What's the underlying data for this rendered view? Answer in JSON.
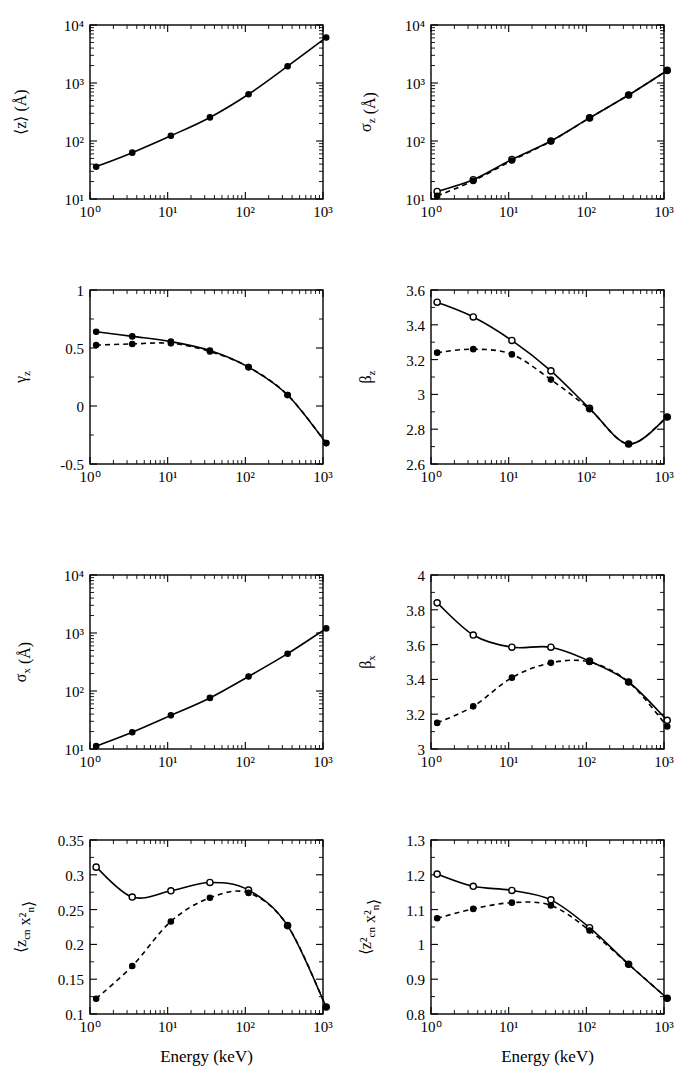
{
  "figure": {
    "xlabel": "Energy (keV)",
    "panels_rows": 4,
    "panels_cols": 2
  },
  "chart_data": [
    {
      "id": "mean-z",
      "type": "line",
      "title": "",
      "xlabel": "",
      "ylabel": "⟨z⟩ (Å)",
      "xscale": "log",
      "yscale": "log",
      "xlim": [
        1,
        1000
      ],
      "ylim": [
        10,
        10000
      ],
      "xticklabels": [
        "10⁰",
        "10¹",
        "10²",
        "10³"
      ],
      "yticklabels": [
        "10¹",
        "10²",
        "10³",
        "10⁴"
      ],
      "grid": false,
      "legend": "none",
      "x": [
        1.2,
        3.5,
        11,
        35,
        110,
        350,
        1100
      ],
      "series": [
        {
          "name": "solid",
          "style": "solid",
          "marker": "filled-circle",
          "values": [
            36,
            63,
            123,
            255,
            640,
            1950,
            6100
          ]
        }
      ]
    },
    {
      "id": "sigma-z",
      "type": "line",
      "title": "",
      "xlabel": "",
      "ylabel": "σ_z (Å)",
      "xscale": "log",
      "yscale": "log",
      "xlim": [
        1,
        1000
      ],
      "ylim": [
        10,
        10000
      ],
      "xticklabels": [
        "10⁰",
        "10¹",
        "10²",
        "10³"
      ],
      "yticklabels": [
        "10¹",
        "10²",
        "10³",
        "10⁴"
      ],
      "grid": false,
      "legend": "none",
      "x": [
        1.2,
        3.5,
        11,
        35,
        110,
        350,
        1100
      ],
      "series": [
        {
          "name": "solid",
          "style": "solid",
          "marker": "open-circle",
          "values": [
            13.5,
            21.5,
            48,
            100,
            250,
            620,
            1650
          ]
        },
        {
          "name": "dashed",
          "style": "dashed",
          "marker": "filled-circle",
          "values": [
            11.3,
            20.5,
            46,
            99,
            250,
            620,
            1650
          ]
        }
      ]
    },
    {
      "id": "gamma-z",
      "type": "line",
      "title": "",
      "xlabel": "",
      "ylabel": "γ_z",
      "xscale": "log",
      "yscale": "linear",
      "xlim": [
        1,
        1000
      ],
      "ylim": [
        -0.5,
        1
      ],
      "xticklabels": [
        "10⁰",
        "10¹",
        "10²",
        "10³"
      ],
      "yticklabels": [
        "-0.5",
        "0",
        "0.5",
        "1"
      ],
      "yticks": [
        -0.5,
        0,
        0.5,
        1
      ],
      "grid": false,
      "legend": "none",
      "x": [
        1.2,
        3.5,
        11,
        35,
        110,
        350,
        1100
      ],
      "series": [
        {
          "name": "solid",
          "style": "solid",
          "marker": "filled-circle",
          "values": [
            0.64,
            0.6,
            0.555,
            0.478,
            0.335,
            0.095,
            -0.32
          ]
        },
        {
          "name": "dashed",
          "style": "dashed",
          "marker": "filled-circle",
          "values": [
            0.525,
            0.535,
            0.54,
            0.47,
            0.335,
            0.095,
            -0.32
          ]
        }
      ]
    },
    {
      "id": "beta-z",
      "type": "line",
      "title": "",
      "xlabel": "",
      "ylabel": "β_z",
      "xscale": "log",
      "yscale": "linear",
      "xlim": [
        1,
        1000
      ],
      "ylim": [
        2.6,
        3.6
      ],
      "xticklabels": [
        "10⁰",
        "10¹",
        "10²",
        "10³"
      ],
      "yticklabels": [
        "2.6",
        "2.8",
        "3",
        "3.2",
        "3.4",
        "3.6"
      ],
      "yticks": [
        2.6,
        2.8,
        3.0,
        3.2,
        3.4,
        3.6
      ],
      "grid": false,
      "legend": "none",
      "x": [
        1.2,
        3.5,
        11,
        35,
        110,
        350,
        1100
      ],
      "series": [
        {
          "name": "solid",
          "style": "solid",
          "marker": "open-circle",
          "values": [
            3.53,
            3.445,
            3.31,
            3.135,
            2.92,
            2.715,
            2.87
          ]
        },
        {
          "name": "dashed",
          "style": "dashed",
          "marker": "filled-circle",
          "values": [
            3.24,
            3.26,
            3.23,
            3.085,
            2.915,
            2.715,
            2.87
          ]
        }
      ]
    },
    {
      "id": "sigma-x",
      "type": "line",
      "title": "",
      "xlabel": "",
      "ylabel": "σ_x (Å)",
      "xscale": "log",
      "yscale": "log",
      "xlim": [
        1,
        1000
      ],
      "ylim": [
        10,
        10000
      ],
      "xticklabels": [
        "10⁰",
        "10¹",
        "10²",
        "10³"
      ],
      "yticklabels": [
        "10¹",
        "10²",
        "10³",
        "10⁴"
      ],
      "grid": false,
      "legend": "none",
      "x": [
        1.2,
        3.5,
        11,
        35,
        110,
        350,
        1100
      ],
      "series": [
        {
          "name": "solid",
          "style": "solid",
          "marker": "filled-circle",
          "values": [
            11.2,
            19.5,
            38,
            76,
            178,
            440,
            1200
          ]
        }
      ]
    },
    {
      "id": "beta-x",
      "type": "line",
      "title": "",
      "xlabel": "",
      "ylabel": "β_x",
      "xscale": "log",
      "yscale": "linear",
      "xlim": [
        1,
        1000
      ],
      "ylim": [
        3,
        4
      ],
      "xticklabels": [
        "10⁰",
        "10¹",
        "10²",
        "10³"
      ],
      "yticklabels": [
        "3",
        "3.2",
        "3.4",
        "3.6",
        "3.8",
        "4"
      ],
      "yticks": [
        3.0,
        3.2,
        3.4,
        3.6,
        3.8,
        4.0
      ],
      "grid": false,
      "legend": "none",
      "x": [
        1.2,
        3.5,
        11,
        35,
        110,
        350,
        1100
      ],
      "series": [
        {
          "name": "solid",
          "style": "solid",
          "marker": "open-circle",
          "values": [
            3.84,
            3.655,
            3.585,
            3.585,
            3.505,
            3.385,
            3.165
          ]
        },
        {
          "name": "dashed",
          "style": "dashed",
          "marker": "filled-circle",
          "values": [
            3.15,
            3.245,
            3.41,
            3.495,
            3.5,
            3.385,
            3.13
          ]
        }
      ]
    },
    {
      "id": "zcn-xn2",
      "type": "line",
      "title": "",
      "xlabel": "Energy (keV)",
      "ylabel": "⟨z_cn x²_n⟩",
      "xscale": "log",
      "yscale": "linear",
      "xlim": [
        1,
        1000
      ],
      "ylim": [
        0.1,
        0.35
      ],
      "xticklabels": [
        "10⁰",
        "10¹",
        "10²",
        "10³"
      ],
      "yticklabels": [
        "0.1",
        "0.15",
        "0.2",
        "0.25",
        "0.3",
        "0.35"
      ],
      "yticks": [
        0.1,
        0.15,
        0.2,
        0.25,
        0.3,
        0.35
      ],
      "grid": false,
      "legend": "none",
      "x": [
        1.2,
        3.5,
        11,
        35,
        110,
        350,
        1100
      ],
      "series": [
        {
          "name": "solid",
          "style": "solid",
          "marker": "open-circle",
          "values": [
            0.311,
            0.268,
            0.277,
            0.289,
            0.278,
            0.227,
            0.11
          ]
        },
        {
          "name": "dashed",
          "style": "dashed",
          "marker": "filled-circle",
          "values": [
            0.122,
            0.169,
            0.233,
            0.267,
            0.274,
            0.227,
            0.11
          ]
        }
      ]
    },
    {
      "id": "zcn2-xn2",
      "type": "line",
      "title": "",
      "xlabel": "Energy (keV)",
      "ylabel": "⟨z²_cn x²_n⟩",
      "xscale": "log",
      "yscale": "linear",
      "xlim": [
        1,
        1000
      ],
      "ylim": [
        0.8,
        1.3
      ],
      "xticklabels": [
        "10⁰",
        "10¹",
        "10²",
        "10³"
      ],
      "yticklabels": [
        "0.8",
        "0.9",
        "1",
        "1.1",
        "1.2",
        "1.3"
      ],
      "yticks": [
        0.8,
        0.9,
        1.0,
        1.1,
        1.2,
        1.3
      ],
      "grid": false,
      "legend": "none",
      "x": [
        1.2,
        3.5,
        11,
        35,
        110,
        350,
        1100
      ],
      "series": [
        {
          "name": "solid",
          "style": "solid",
          "marker": "open-circle",
          "values": [
            1.202,
            1.167,
            1.155,
            1.128,
            1.048,
            0.943,
            0.845
          ]
        },
        {
          "name": "dashed",
          "style": "dashed",
          "marker": "filled-circle",
          "values": [
            1.075,
            1.102,
            1.12,
            1.112,
            1.04,
            0.943,
            0.845
          ]
        }
      ]
    }
  ]
}
